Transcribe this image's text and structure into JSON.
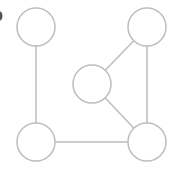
{
  "diagram": {
    "type": "graph",
    "stroke_color": "#bdbdbd",
    "background": "#ffffff",
    "node_radius": 19,
    "nodes": [
      {
        "id": "top-left",
        "cx": 36,
        "cy": 27
      },
      {
        "id": "top-right",
        "cx": 147,
        "cy": 27
      },
      {
        "id": "middle",
        "cx": 92,
        "cy": 84
      },
      {
        "id": "bottom-left",
        "cx": 36,
        "cy": 142
      },
      {
        "id": "bottom-right",
        "cx": 147,
        "cy": 142
      }
    ],
    "edges": [
      {
        "from": "top-left",
        "to": "bottom-left"
      },
      {
        "from": "bottom-left",
        "to": "bottom-right"
      },
      {
        "from": "top-right",
        "to": "bottom-right"
      },
      {
        "from": "top-right",
        "to": "middle"
      },
      {
        "from": "middle",
        "to": "bottom-right"
      }
    ]
  }
}
